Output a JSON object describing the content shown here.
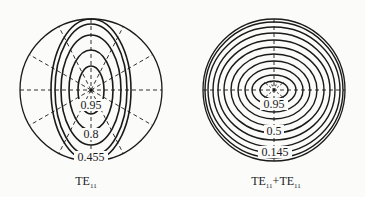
{
  "figures": [
    {
      "id": "te11",
      "caption": "TE",
      "caption_sub": "11",
      "contour_labels": [
        "0.95",
        "0.8",
        "0.455"
      ]
    },
    {
      "id": "te11_plus_te11",
      "caption_parts": [
        "TE",
        "11",
        "+TE",
        "11"
      ],
      "contour_labels": [
        "0.95",
        "0.5",
        "0.145"
      ]
    }
  ],
  "colors": {
    "line": "#1a1a1a",
    "background": "#fbfbfa"
  }
}
